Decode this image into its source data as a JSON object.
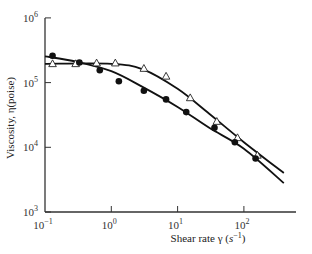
{
  "chart_data": {
    "type": "scatter",
    "title": "",
    "xlabel": "Shear rate γ (s⁻¹)",
    "ylabel": "Viscosity, η(poise)",
    "xscale": "log",
    "yscale": "log",
    "xlim": [
      0.1,
      500
    ],
    "ylim": [
      1000,
      1000000
    ],
    "grid": false,
    "legend": null,
    "x_ticks": [
      {
        "base": "10",
        "exp": "−1",
        "value": 0.1
      },
      {
        "base": "10",
        "exp": "0",
        "value": 1
      },
      {
        "base": "10",
        "exp": "1",
        "value": 10
      },
      {
        "base": "10",
        "exp": "2",
        "value": 100
      }
    ],
    "y_ticks": [
      {
        "base": "10",
        "exp": "3",
        "value": 1000
      },
      {
        "base": "10",
        "exp": "4",
        "value": 10000
      },
      {
        "base": "10",
        "exp": "5",
        "value": 100000
      },
      {
        "base": "10",
        "exp": "6",
        "value": 1000000
      }
    ],
    "series": [
      {
        "name": "open triangles",
        "marker": "triangle-open",
        "x": [
          0.13,
          0.29,
          0.6,
          1.15,
          3.1,
          6.7,
          15.5,
          39,
          80,
          160
        ],
        "y": [
          195000,
          195000,
          200000,
          200000,
          165000,
          125000,
          58000,
          25000,
          14000,
          7500
        ]
      },
      {
        "name": "filled circles",
        "marker": "circle-filled",
        "x": [
          0.13,
          0.33,
          0.67,
          1.3,
          3.1,
          6.7,
          13.5,
          36,
          73,
          150
        ],
        "y": [
          260000,
          205000,
          155000,
          105000,
          75000,
          55000,
          35000,
          20000,
          12000,
          6700
        ]
      }
    ],
    "fit_curves": [
      {
        "name": "triangle fit",
        "x": [
          0.1,
          1,
          3,
          10,
          30,
          100,
          400
        ],
        "y": [
          195000,
          195000,
          160000,
          80000,
          33000,
          12000,
          4000
        ]
      },
      {
        "name": "circle fit",
        "x": [
          0.1,
          0.3,
          1,
          3,
          10,
          30,
          100,
          400
        ],
        "y": [
          255000,
          210000,
          150000,
          85000,
          42000,
          20000,
          9500,
          2800
        ]
      }
    ]
  },
  "axes": {
    "x_title_main": "Shear rate γ (",
    "x_title_unit": "s",
    "x_title_exp": "−1",
    "x_title_close": ")",
    "y_title": "Viscosity, η(poise)"
  }
}
